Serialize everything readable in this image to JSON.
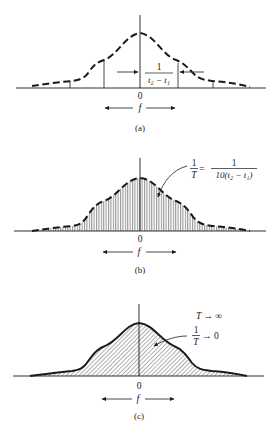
{
  "panels": [
    {
      "id": "a",
      "caption": "(a)",
      "origin_label": "0",
      "axis_label": "f",
      "annotation": {
        "numerator": "1",
        "denominator": "t₂ − t₁"
      },
      "curve_style": "dashed",
      "fill": "none"
    },
    {
      "id": "b",
      "caption": "(b)",
      "origin_label": "0",
      "axis_label": "f",
      "annotation": {
        "lhs_numerator": "1",
        "lhs_denominator": "T",
        "equals": "=",
        "rhs_numerator": "1",
        "rhs_denominator": "10(t₂ − t₁)"
      },
      "curve_style": "dashed",
      "fill": "vertical-lines"
    },
    {
      "id": "c",
      "caption": "(c)",
      "origin_label": "0",
      "axis_label": "f",
      "annotation": {
        "line1": "T → ∞",
        "numerator": "1",
        "denominator": "T",
        "arrow_text": "→ 0"
      },
      "curve_style": "solid",
      "fill": "diagonal-hatch"
    }
  ],
  "colors": {
    "ink": "#1a1a1a",
    "background": "#ffffff"
  }
}
